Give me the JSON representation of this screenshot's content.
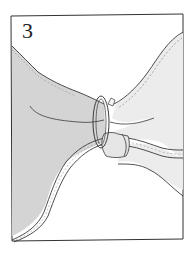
{
  "figure": {
    "step_number": "3",
    "colors": {
      "frame": "#333333",
      "line": "#3a3a3a",
      "left_cloth_fill": "#d4d4d4",
      "right_cloth_fill": "#ececec",
      "background": "#ffffff"
    }
  }
}
